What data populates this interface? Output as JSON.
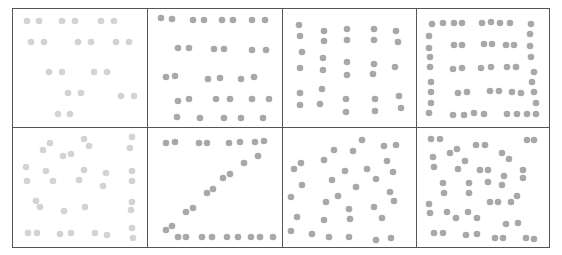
{
  "figure": {
    "layout": {
      "rows": 2,
      "columns": 4
    },
    "colors": {
      "background": "#ffffff",
      "grid_line": "#555555",
      "dot_light": "#d3d3d3",
      "dot_medium": "#a8a8a8"
    },
    "panels": [
      {
        "id": "r1c1",
        "pattern": "paired-rows-sparse",
        "shade": "light"
      },
      {
        "id": "r1c2",
        "pattern": "paired-rows-dense",
        "shade": "medium"
      },
      {
        "id": "r1c3",
        "pattern": "vertical-columns",
        "shade": "medium"
      },
      {
        "id": "r1c4",
        "pattern": "nested-rectangle",
        "shade": "medium"
      },
      {
        "id": "r2c1",
        "pattern": "scattered-with-right-column",
        "shade": "light"
      },
      {
        "id": "r2c2",
        "pattern": "letter-z",
        "shade": "medium"
      },
      {
        "id": "r2c3",
        "pattern": "random-scatter",
        "shade": "medium"
      },
      {
        "id": "r2c4",
        "pattern": "spiral-pairs",
        "shade": "medium"
      }
    ]
  }
}
